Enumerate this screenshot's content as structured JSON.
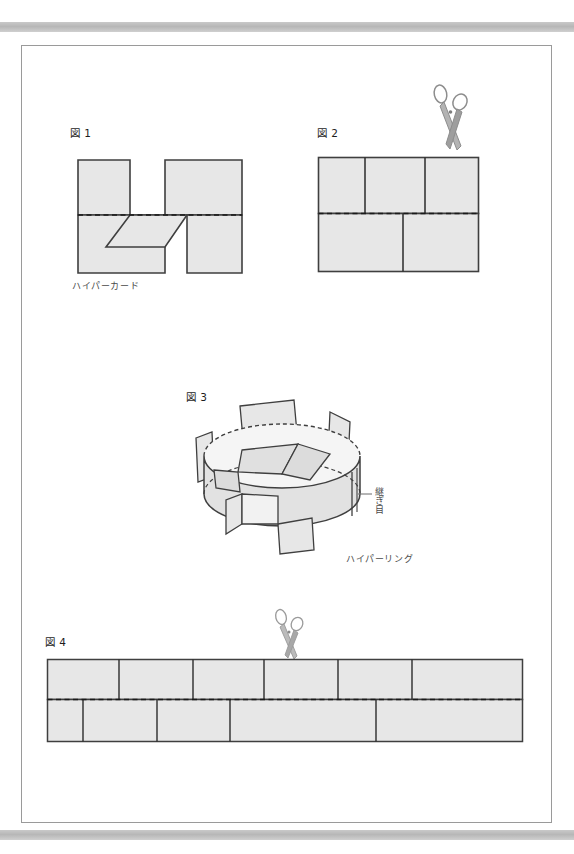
{
  "page": {
    "background_color": "#ffffff",
    "sheet_border_color": "#9a9a9a",
    "scan_bar_color": "#b7b7b7"
  },
  "style": {
    "paper_fill": "#e7e7e7",
    "paper_fill_dark": "#dcdcdc",
    "outline_color": "#3f3f3f",
    "cut_line_color": "#2b2b2b",
    "fold_line_color": "#1a1a1a",
    "scissors_color": "#8d8d8d",
    "leader_color": "#6a6a6a"
  },
  "figures": [
    {
      "id": "fig1",
      "label": "図 1",
      "caption": "ハイパーカード",
      "caption_role": "part-name",
      "description": "H-shaped card with dashed horizontal fold line and a diagonal slit flap",
      "has_scissors": false,
      "fold_line": "dashed-horizontal-center"
    },
    {
      "id": "fig2",
      "label": "図 2",
      "caption": "",
      "description": "Rectangle with dashed horizontal fold line, two cut lines in upper half and one cut line in lower half",
      "has_scissors": true,
      "fold_line": "dashed-horizontal-center",
      "cuts_top": 2,
      "cuts_bottom": 1
    },
    {
      "id": "fig3",
      "label": "図 3",
      "caption": "ハイパーリング",
      "caption_role": "part-name",
      "annotation": "継ぎ目",
      "annotation_role": "seam-callout",
      "description": "Three-dimensional ring band with inward folded tabs and dashed hidden edges",
      "has_scissors": false
    },
    {
      "id": "fig4",
      "label": "図 4",
      "caption": "",
      "description": "Long horizontal strip with dashed horizontal fold line, five cut lines in the upper half and four staggered cut lines in the lower half",
      "has_scissors": true,
      "fold_line": "dashed-horizontal-center",
      "cuts_top": 5,
      "cuts_bottom": 4
    }
  ],
  "icons": {
    "scissors": "scissors-icon"
  }
}
